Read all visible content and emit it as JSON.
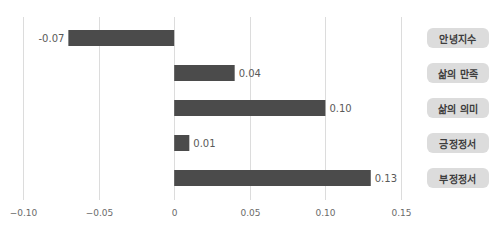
{
  "chart_data": {
    "type": "bar",
    "orientation": "horizontal",
    "title": "",
    "xlabel": "",
    "ylabel": "",
    "categories": [
      "안녕지수",
      "삶의 만족",
      "삶의 의미",
      "긍정정서",
      "부정정서"
    ],
    "values": [
      -0.07,
      0.04,
      0.1,
      0.01,
      0.13
    ],
    "value_labels": [
      "-0.07",
      "0.04",
      "0.10",
      "0.01",
      "0.13"
    ],
    "xlim": [
      -0.1,
      0.15
    ],
    "x_ticks": [
      -0.1,
      -0.05,
      0,
      0.05,
      0.1,
      0.15
    ],
    "x_tick_labels": [
      "−0.10",
      "−0.05",
      "0",
      "0.05",
      "0.10",
      "0.15"
    ],
    "grid": "vertical",
    "legend": "none",
    "category_label_position": "right",
    "colors": {
      "bar": "#4b4b4b",
      "grid": "#dcdcdc",
      "pill_bg": "#dcdcdc",
      "pill_text": "#3d3d3d"
    }
  }
}
